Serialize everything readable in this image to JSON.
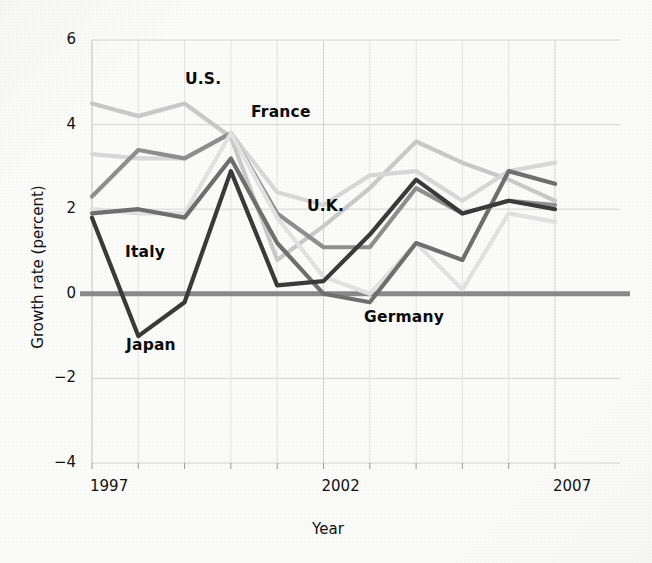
{
  "chart_data": {
    "type": "line",
    "title": "",
    "xlabel": "Year",
    "ylabel": "Growth rate (percent)",
    "x": [
      1997,
      1998,
      1999,
      2000,
      2001,
      2002,
      2003,
      2004,
      2005,
      2006,
      2007
    ],
    "xlim": [
      1997,
      2007
    ],
    "ylim": [
      -4,
      6
    ],
    "xticks": [
      1997,
      2002,
      2007
    ],
    "xticklabels": [
      "1997",
      "2002",
      "2007"
    ],
    "yticks": [
      -4,
      -2,
      0,
      2,
      4,
      6
    ],
    "yticklabels": [
      "−4",
      "−2",
      "0",
      "2",
      "4",
      "6"
    ],
    "grid": "both",
    "grid_minor_x": [
      1998,
      1999,
      2000,
      2001,
      2003,
      2004,
      2005,
      2006
    ],
    "legend": "inline-annotations",
    "zero_line": 0,
    "series": [
      {
        "name": "U.S.",
        "color": "#c9c9c9",
        "values": [
          4.5,
          4.2,
          4.5,
          3.7,
          0.8,
          1.6,
          2.5,
          3.6,
          3.1,
          2.7,
          2.2
        ]
      },
      {
        "name": "U.K.",
        "color": "#d8d8d8",
        "values": [
          3.3,
          3.2,
          3.2,
          3.8,
          2.4,
          2.1,
          2.8,
          2.9,
          2.2,
          2.9,
          3.1
        ]
      },
      {
        "name": "France",
        "color": "#8f8f8f",
        "values": [
          2.3,
          3.4,
          3.2,
          3.8,
          1.9,
          1.1,
          1.1,
          2.5,
          1.9,
          2.2,
          2.1
        ]
      },
      {
        "name": "Italy",
        "color": "#e2e2e2",
        "values": [
          2.0,
          1.9,
          1.9,
          3.8,
          1.8,
          0.4,
          0.0,
          1.2,
          0.1,
          1.9,
          1.7
        ]
      },
      {
        "name": "Germany",
        "color": "#6f6f6f",
        "values": [
          1.9,
          2.0,
          1.8,
          3.2,
          1.2,
          0.0,
          -0.2,
          1.2,
          0.8,
          2.9,
          2.6
        ]
      },
      {
        "name": "Japan",
        "color": "#3a3a3a",
        "values": [
          1.8,
          -1.0,
          -0.2,
          2.9,
          0.2,
          0.3,
          1.4,
          2.7,
          1.9,
          2.2,
          2.0
        ]
      }
    ],
    "annotations": [
      {
        "text": "U.S.",
        "x_px": 185,
        "y_px": 70
      },
      {
        "text": "France",
        "x_px": 251,
        "y_px": 103
      },
      {
        "text": "U.K.",
        "x_px": 307,
        "y_px": 197
      },
      {
        "text": "Italy",
        "x_px": 125,
        "y_px": 243
      },
      {
        "text": "Germany",
        "x_px": 364,
        "y_px": 308
      },
      {
        "text": "Japan",
        "x_px": 126,
        "y_px": 336
      }
    ]
  },
  "axis": {
    "x_title": "Year",
    "y_title": "Growth rate (percent)"
  },
  "colors": {
    "zero_line": "#8a8a8a",
    "grid": "#d4d4d4",
    "grid_minor": "#e3e3e3",
    "text": "#111111",
    "background": "#fbfbfa"
  }
}
